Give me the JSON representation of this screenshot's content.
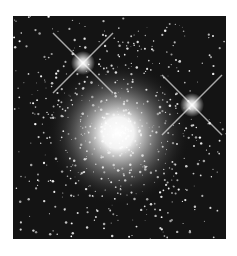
{
  "image": {
    "subject": "globular star cluster",
    "background_color": "#ffffff",
    "field_color": "#141414",
    "frame": {
      "x": 13,
      "y": 16,
      "width": 213,
      "height": 223
    },
    "cluster_core": {
      "cx": 105,
      "cy": 117,
      "r": 70
    },
    "bright_stars": [
      {
        "cx": 70,
        "cy": 47,
        "spike_len": 40
      },
      {
        "cx": 179,
        "cy": 89,
        "spike_len": 40
      }
    ]
  }
}
